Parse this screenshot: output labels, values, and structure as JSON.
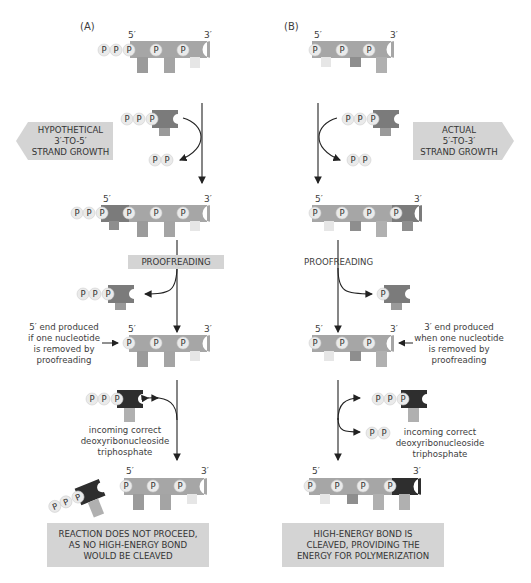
{
  "panels": {
    "A": {
      "label": "(A)",
      "direction_box": "HYPOTHETICAL\n3′-TO-5′\nSTRAND GROWTH",
      "proofreading_label": "PROOFREADING",
      "end_note": "5′ end produced\nif one nucleotide\nis removed by\nproofreading",
      "incoming_note": "incoming correct\ndeoxyribonucleoside\ntriphosphate",
      "result_box": "REACTION DOES NOT PROCEED,\nAS NO HIGH-ENERGY BOND\nWOULD BE CLEAVED"
    },
    "B": {
      "label": "(B)",
      "direction_box": "ACTUAL\n5′-TO-3′\nSTRAND GROWTH",
      "proofreading_label": "PROOFREADING",
      "end_note": "3′ end produced\nwhen one nucleotide\nis removed by\nproofreading",
      "incoming_note": "incoming correct\ndeoxyribonucleoside\ntriphosphate",
      "result_box": "HIGH-ENERGY BOND IS\nCLEAVED, PROVIDING THE\nENERGY FOR POLYMERIZATION"
    }
  },
  "labels": {
    "five_prime": "5′",
    "three_prime": "3′",
    "phosphate": "P"
  },
  "colors": {
    "backbone": "#a9a9a9",
    "new_nucleotide": "#7b7b7b",
    "incoming_dark": "#2e2e2e",
    "base_light": "#e6e6e6",
    "phosphate_fill": "#e9e9e9",
    "box_fill": "#d4d4d4",
    "arrow": "#222222"
  }
}
